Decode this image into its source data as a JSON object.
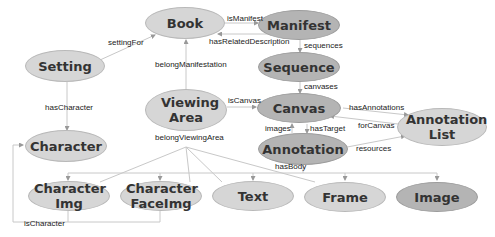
{
  "nodes": {
    "book": "Book",
    "manifest": "Manifest",
    "setting": "Setting",
    "sequence": "Sequence",
    "viewing_area": "Viewing Area",
    "canvas": "Canvas",
    "annotation_list": "Annotation List",
    "character": "Character",
    "annotation": "Annotation",
    "character_img": "Character Img",
    "character_faceimg": "Character FaceImg",
    "text": "Text",
    "frame": "Frame",
    "image": "Image"
  },
  "edges": {
    "isManifest": "isManifest",
    "hasRelatedDescription": "hasRelatedDescription",
    "settingFor": "settingFor",
    "sequences": "sequences",
    "belongManifestation": "belongManifestation",
    "canvases": "canvases",
    "isCanvas": "isCanvas",
    "hasAnnotations": "hasAnnotations",
    "hasCharacter": "hasCharacter",
    "images": "images",
    "hasTarget": "hasTarget",
    "forCanvas": "forCanvas",
    "belongViewingArea": "belongViewingArea",
    "resources": "resources",
    "hasBody": "hasBody",
    "isCharacter": "isCharacter"
  },
  "colors": {
    "light_node": "#d6d6d6",
    "dark_node": "#b4b4b4",
    "edge": "#c8c8c8"
  }
}
